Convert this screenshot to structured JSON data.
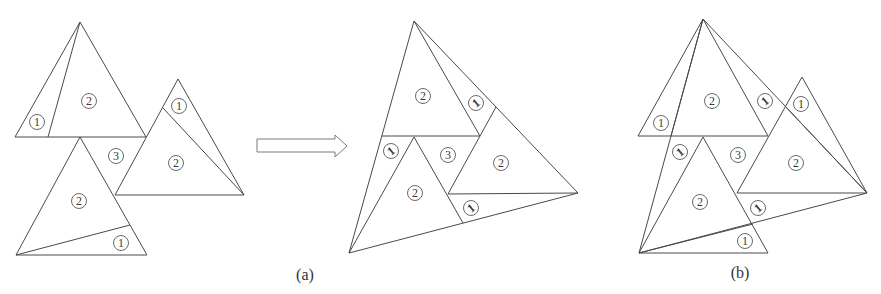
{
  "figure": {
    "captions": {
      "a": "(a)",
      "b": "(b)"
    },
    "arrow": {
      "direction": "right",
      "meaning": "transform"
    },
    "left_figure": {
      "labels": [
        {
          "text": "1",
          "x": 37,
          "y": 122,
          "rotated": false
        },
        {
          "text": "2",
          "x": 89,
          "y": 101,
          "rotated": false
        },
        {
          "text": "3",
          "x": 116,
          "y": 156,
          "rotated": false
        },
        {
          "text": "1",
          "x": 179,
          "y": 106,
          "rotated": false
        },
        {
          "text": "2",
          "x": 176,
          "y": 163,
          "rotated": false
        },
        {
          "text": "2",
          "x": 79,
          "y": 201,
          "rotated": false
        },
        {
          "text": "1",
          "x": 121,
          "y": 243,
          "rotated": false
        }
      ]
    },
    "middle_figure": {
      "labels": [
        {
          "text": "2",
          "x": 423,
          "y": 96,
          "rotated": false
        },
        {
          "text": "1",
          "x": 476,
          "y": 103,
          "rotated": true
        },
        {
          "text": "1",
          "x": 391,
          "y": 151,
          "rotated": true
        },
        {
          "text": "3",
          "x": 448,
          "y": 155,
          "rotated": false
        },
        {
          "text": "2",
          "x": 501,
          "y": 163,
          "rotated": false
        },
        {
          "text": "2",
          "x": 415,
          "y": 193,
          "rotated": false
        },
        {
          "text": "1",
          "x": 471,
          "y": 208,
          "rotated": true
        }
      ]
    },
    "right_figure": {
      "labels": [
        {
          "text": "1",
          "x": 661,
          "y": 123,
          "rotated": false
        },
        {
          "text": "2",
          "x": 712,
          "y": 101,
          "rotated": false
        },
        {
          "text": "1",
          "x": 765,
          "y": 101,
          "rotated": true
        },
        {
          "text": "1",
          "x": 801,
          "y": 104,
          "rotated": false
        },
        {
          "text": "1",
          "x": 680,
          "y": 152,
          "rotated": true
        },
        {
          "text": "3",
          "x": 738,
          "y": 155,
          "rotated": false
        },
        {
          "text": "2",
          "x": 796,
          "y": 163,
          "rotated": false
        },
        {
          "text": "2",
          "x": 700,
          "y": 202,
          "rotated": false
        },
        {
          "text": "1",
          "x": 758,
          "y": 208,
          "rotated": true
        },
        {
          "text": "1",
          "x": 745,
          "y": 241,
          "rotated": false
        }
      ]
    }
  }
}
